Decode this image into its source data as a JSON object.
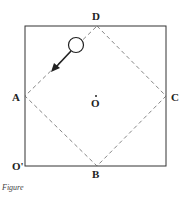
{
  "figure": {
    "caption": "Figure",
    "labels": {
      "A": "A",
      "B": "B",
      "C": "C",
      "D": "D",
      "O": "O",
      "O_prime": "O'"
    },
    "square": {
      "x": 25,
      "y": 26,
      "size": 141,
      "stroke": "#333333"
    },
    "diamond": {
      "points": [
        [
          97,
          26
        ],
        [
          166,
          96
        ],
        [
          97,
          166
        ],
        [
          25,
          96
        ]
      ],
      "dash": "4,3",
      "stroke": "#555555"
    },
    "ball": {
      "cx": 76,
      "cy": 45,
      "r": 8
    },
    "arrow": {
      "x1": 70,
      "y1": 51,
      "x2": 53,
      "y2": 70
    }
  }
}
